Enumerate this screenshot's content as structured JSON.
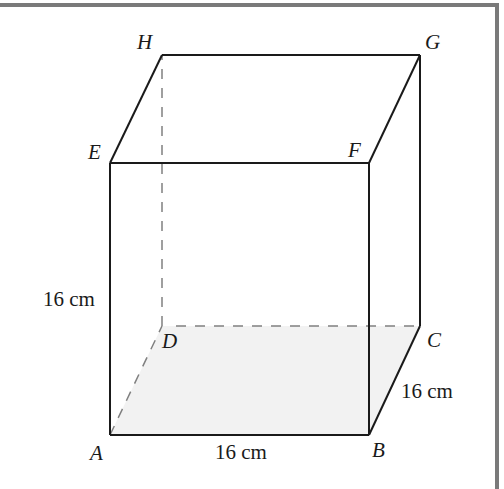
{
  "figure": {
    "type": "cube",
    "colors": {
      "edge": "#1a1a1a",
      "hidden_edge": "#808080",
      "base_fill": "#f2f2f2",
      "frame": "#7a7a7a",
      "background": "#ffffff"
    },
    "vertices": {
      "A": {
        "label": "A",
        "x": 110,
        "y": 435
      },
      "B": {
        "label": "B",
        "x": 369,
        "y": 435
      },
      "C": {
        "label": "C",
        "x": 420,
        "y": 326
      },
      "D": {
        "label": "D",
        "x": 162,
        "y": 326
      },
      "E": {
        "label": "E",
        "x": 110,
        "y": 163
      },
      "F": {
        "label": "F",
        "x": 369,
        "y": 163
      },
      "G": {
        "label": "G",
        "x": 420,
        "y": 55
      },
      "H": {
        "label": "H",
        "x": 162,
        "y": 55
      }
    },
    "dimensions": {
      "height_AE": "16 cm",
      "length_AB": "16 cm",
      "depth_BC": "16 cm"
    },
    "hidden_edges": [
      "AD",
      "DC",
      "DH"
    ],
    "visible_edges": [
      "AB",
      "BC",
      "CG",
      "GH",
      "HE",
      "EA",
      "EF",
      "FB",
      "FG"
    ]
  }
}
